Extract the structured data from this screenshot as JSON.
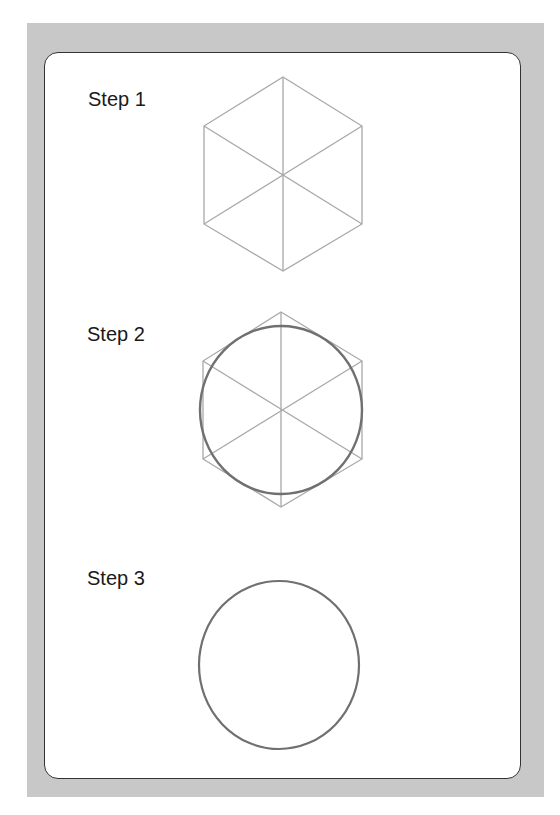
{
  "steps": [
    {
      "label": "Step 1",
      "description": "hexagon with diagonals"
    },
    {
      "label": "Step 2",
      "description": "hexagon with diagonals and inscribed circle"
    },
    {
      "label": "Step 3",
      "description": "circle"
    }
  ],
  "colors": {
    "frame": "#c8c8c8",
    "panel_border": "#333333",
    "construction_line": "#a8a8a8",
    "circle_line": "#707070",
    "text": "#1a1a1a"
  }
}
